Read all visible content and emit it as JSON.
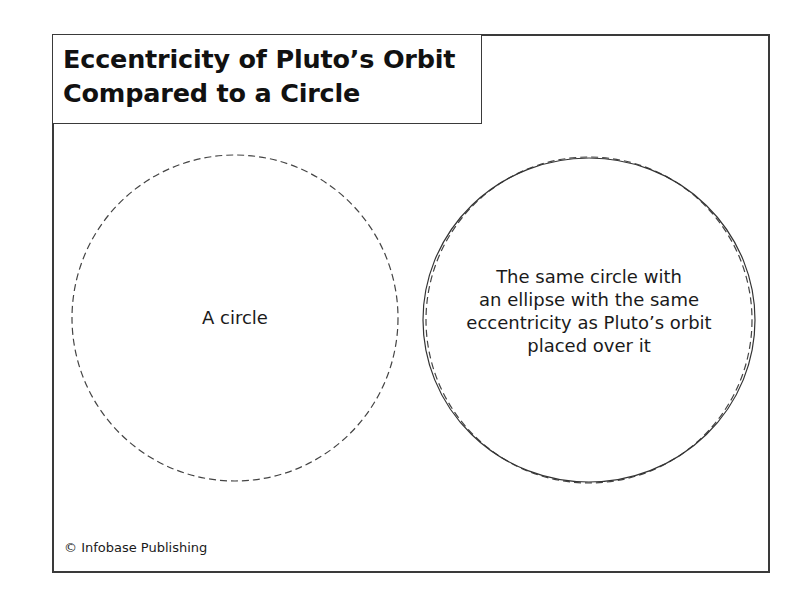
{
  "title": {
    "line1": "Eccentricity of Pluto’s Orbit",
    "line2": "Compared to a Circle"
  },
  "left_figure": {
    "label": "A circle",
    "shape": "dashed-circle"
  },
  "right_figure": {
    "label_lines": [
      "The same circle with",
      "an ellipse with the same",
      "eccentricity as Pluto’s orbit",
      "placed over it"
    ],
    "shapes": [
      "dashed-circle",
      "solid-ellipse"
    ]
  },
  "credit": "© Infobase Publishing",
  "colors": {
    "stroke": "#3a3a3a",
    "text": "#1a1a1a",
    "background": "#ffffff"
  }
}
